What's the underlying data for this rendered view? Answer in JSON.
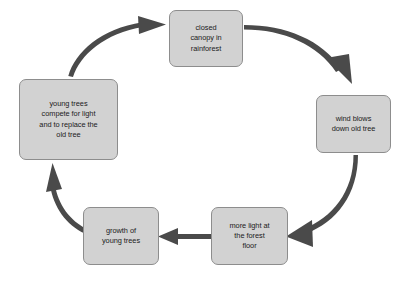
{
  "diagram": {
    "type": "cycle-diagram",
    "colors": {
      "box_fill": "#d2d2d2",
      "box_border": "#8d8d8d",
      "arrow": "#4a4a4a",
      "text": "#1b1b1b",
      "background": "#ffffff"
    },
    "nodes": [
      {
        "id": "closed-canopy",
        "label": "closed\ncanopy in\nrainforest",
        "position": "top"
      },
      {
        "id": "wind-blows",
        "label": "wind blows\ndown old tree",
        "position": "right"
      },
      {
        "id": "more-light",
        "label": "more light at\nthe forest\nfloor",
        "position": "bottom-right"
      },
      {
        "id": "growth-young-trees",
        "label": "growth of\nyoung trees",
        "position": "bottom-left"
      },
      {
        "id": "young-trees-compete",
        "label": "young trees\ncompete for light\nand to replace the\nold tree",
        "position": "left"
      }
    ],
    "arrows": [
      {
        "id": "arrow-canopy-to-wind",
        "from": "closed-canopy",
        "to": "wind-blows"
      },
      {
        "id": "arrow-wind-to-light",
        "from": "wind-blows",
        "to": "more-light"
      },
      {
        "id": "arrow-light-to-growth",
        "from": "more-light",
        "to": "growth-young-trees"
      },
      {
        "id": "arrow-growth-to-compete",
        "from": "growth-young-trees",
        "to": "young-trees-compete"
      },
      {
        "id": "arrow-compete-to-canopy",
        "from": "young-trees-compete",
        "to": "closed-canopy"
      }
    ]
  }
}
